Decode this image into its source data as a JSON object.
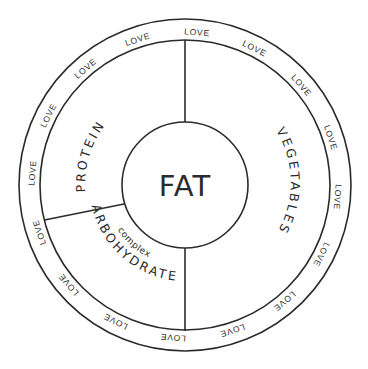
{
  "diagram": {
    "type": "nutrition-wheel",
    "center": {
      "label": "FAT"
    },
    "segments": [
      {
        "id": "protein",
        "label": "PROTEIN"
      },
      {
        "id": "vegetables",
        "label": "VEGETABLES"
      },
      {
        "id": "carbohydrates",
        "label": "CARBOHYDRATES",
        "sublabel": "complex"
      }
    ],
    "outer_ring": {
      "word": "LOVE",
      "repeat_count": 16,
      "items": [
        "LOVE",
        "LOVE",
        "LOVE",
        "LOVE",
        "LOVE",
        "LOVE",
        "LOVE",
        "LOVE",
        "LOVE",
        "LOVE",
        "LOVE",
        "LOVE",
        "LOVE",
        "LOVE",
        "LOVE",
        "LOVE"
      ]
    },
    "colors": {
      "line": "#2b2b2b",
      "background": "#ffffff",
      "text": "#2b2b2b"
    }
  }
}
